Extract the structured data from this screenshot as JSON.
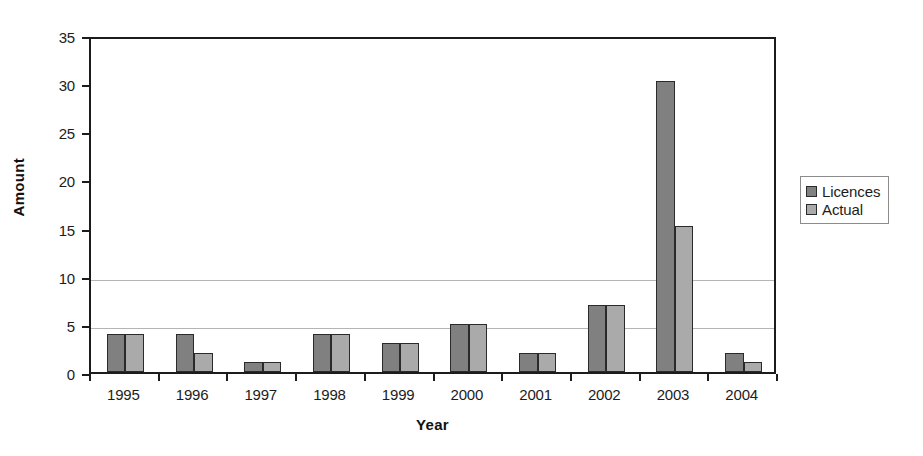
{
  "chart_data": {
    "type": "bar",
    "title": "",
    "xlabel": "Year",
    "ylabel": "Amount",
    "categories": [
      "1995",
      "1996",
      "1997",
      "1998",
      "1999",
      "2000",
      "2001",
      "2002",
      "2003",
      "2004"
    ],
    "series": [
      {
        "name": "Licences",
        "color": "#808080",
        "values": [
          4,
          4,
          1,
          4,
          3,
          5,
          2,
          7,
          30.2,
          2
        ]
      },
      {
        "name": "Actual",
        "color": "#aaaaaa",
        "values": [
          4,
          2,
          1,
          4,
          3,
          5,
          2,
          7,
          15.2,
          1
        ]
      }
    ],
    "ylim": [
      0,
      35
    ],
    "yticks": [
      0,
      5,
      10,
      15,
      20,
      25,
      30,
      35
    ],
    "ytick_labels": [
      "0",
      "5",
      "10",
      "15",
      "20",
      "25",
      "30",
      "35"
    ],
    "gridlines": [
      5,
      10
    ],
    "grid": true,
    "legend_position": "right",
    "legend_entries": [
      "Licences",
      "Actual"
    ]
  }
}
